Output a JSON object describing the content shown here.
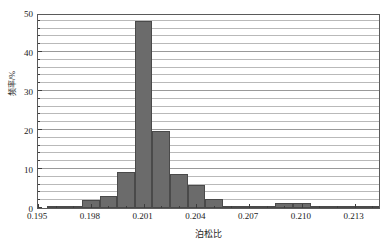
{
  "chart_data": {
    "type": "bar",
    "title": "",
    "subtitle": "",
    "xlabel": "泊松比",
    "ylabel": "频率/%",
    "xlim": [
      0.195,
      0.2145
    ],
    "ylim": [
      0,
      50
    ],
    "grid": true,
    "legend": null,
    "bin_width": 0.001,
    "x_ticks": [
      "0.195",
      "0.198",
      "0.201",
      "0.204",
      "0.207",
      "0.210",
      "0.213"
    ],
    "x_tick_values": [
      0.195,
      0.198,
      0.201,
      0.204,
      0.207,
      0.21,
      0.213
    ],
    "y_ticks": [
      "0",
      "10",
      "20",
      "30",
      "40",
      "50"
    ],
    "y_tick_values": [
      0,
      10,
      20,
      30,
      40,
      50
    ],
    "y_minor_step": 2,
    "bar_color": "#6b6b6b",
    "bar_edge_color": "#4a4a4a",
    "categories": [
      "0.1955",
      "0.1965",
      "0.1975",
      "0.1985",
      "0.1995",
      "0.2005",
      "0.2015",
      "0.2025",
      "0.2035",
      "0.2045",
      "0.2055",
      "0.2065",
      "0.2075",
      "0.2085",
      "0.2095",
      "0.2105",
      "0.2115",
      "0.2125",
      "0.2135"
    ],
    "bin_edges": [
      0.1955,
      0.1965,
      0.1975,
      0.1985,
      0.1995,
      0.2005,
      0.2015,
      0.2025,
      0.2035,
      0.2045,
      0.2055,
      0.2065,
      0.2075,
      0.2085,
      0.2095,
      0.2105,
      0.2115,
      0.2125,
      0.2135,
      0.2145
    ],
    "values": [
      0.3,
      0.3,
      2.0,
      3.1,
      9.3,
      48.0,
      19.8,
      8.8,
      6.0,
      2.2,
      0.6,
      0.4,
      0.4,
      1.2,
      1.3,
      0.4,
      0.3,
      0.3,
      0.3
    ]
  }
}
